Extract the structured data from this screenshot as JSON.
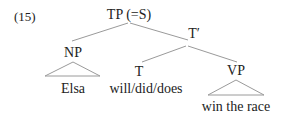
{
  "example_number": "(15)",
  "nodes": {
    "tp": "TP (=S)",
    "tbar": "T′",
    "np": "NP",
    "t": "T",
    "vp": "VP"
  },
  "leaves": {
    "np": "Elsa",
    "t": "will/did/does",
    "vp": "win the race"
  },
  "colors": {
    "line": "#9a9a9a",
    "text": "#222222"
  }
}
